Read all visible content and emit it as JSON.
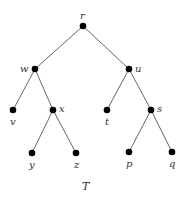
{
  "diagram": {
    "type": "binary-tree",
    "caption": "T",
    "nodes": [
      {
        "id": "r",
        "label": "r",
        "x": 83,
        "y": 26
      },
      {
        "id": "w",
        "label": "w",
        "x": 35,
        "y": 69
      },
      {
        "id": "u",
        "label": "u",
        "x": 129,
        "y": 69
      },
      {
        "id": "v",
        "label": "v",
        "x": 13,
        "y": 110
      },
      {
        "id": "x",
        "label": "x",
        "x": 53,
        "y": 110
      },
      {
        "id": "t",
        "label": "t",
        "x": 107,
        "y": 110
      },
      {
        "id": "s",
        "label": "s",
        "x": 151,
        "y": 110
      },
      {
        "id": "y",
        "label": "y",
        "x": 32,
        "y": 153
      },
      {
        "id": "z",
        "label": "z",
        "x": 76,
        "y": 153
      },
      {
        "id": "p",
        "label": "p",
        "x": 129,
        "y": 152
      },
      {
        "id": "q",
        "label": "q",
        "x": 172,
        "y": 152
      }
    ],
    "edges": [
      [
        "r",
        "w"
      ],
      [
        "r",
        "u"
      ],
      [
        "w",
        "v"
      ],
      [
        "w",
        "x"
      ],
      [
        "u",
        "t"
      ],
      [
        "u",
        "s"
      ],
      [
        "x",
        "y"
      ],
      [
        "x",
        "z"
      ],
      [
        "s",
        "p"
      ],
      [
        "s",
        "q"
      ]
    ]
  }
}
